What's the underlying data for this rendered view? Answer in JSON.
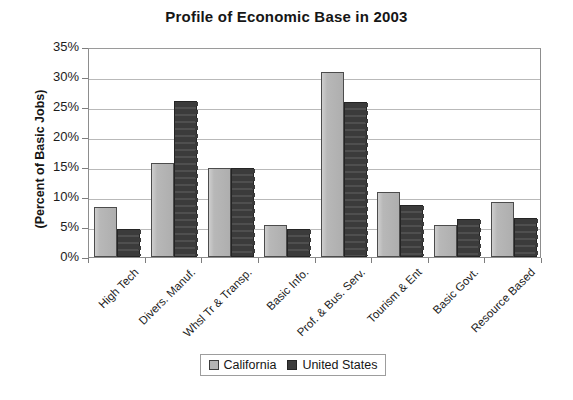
{
  "chart_data": {
    "type": "bar",
    "title": "Profile of Economic Base in 2003",
    "xlabel": "",
    "ylabel": "(Percent of Basic Jobs)",
    "ylim": [
      0,
      35
    ],
    "ytick_labels": [
      "0%",
      "5%",
      "10%",
      "15%",
      "20%",
      "25%",
      "30%",
      "35%"
    ],
    "ytick_values": [
      0,
      5,
      10,
      15,
      20,
      25,
      30,
      35
    ],
    "grid": true,
    "legend_position": "bottom",
    "categories": [
      "High Tech",
      "Divers. Manuf.",
      "Whsl Tr & Transp.",
      "Basic Info.",
      "Prof. & Bus. Serv.",
      "Tourism & Ent",
      "Basic Govt.",
      "Resource Based"
    ],
    "series": [
      {
        "name": "California",
        "color": "#b4b4b4",
        "values": [
          8.3,
          15.6,
          14.9,
          5.3,
          30.8,
          10.8,
          5.3,
          9.2
        ]
      },
      {
        "name": "United States",
        "color": "#3b3b3b",
        "values": [
          4.6,
          26.0,
          14.9,
          4.7,
          25.9,
          8.6,
          6.4,
          6.5
        ]
      }
    ]
  },
  "legend": {
    "entries": [
      {
        "label": "California",
        "swatch": "light-gray-swatch-icon"
      },
      {
        "label": "United States",
        "swatch": "dark-gray-swatch-icon"
      }
    ]
  }
}
